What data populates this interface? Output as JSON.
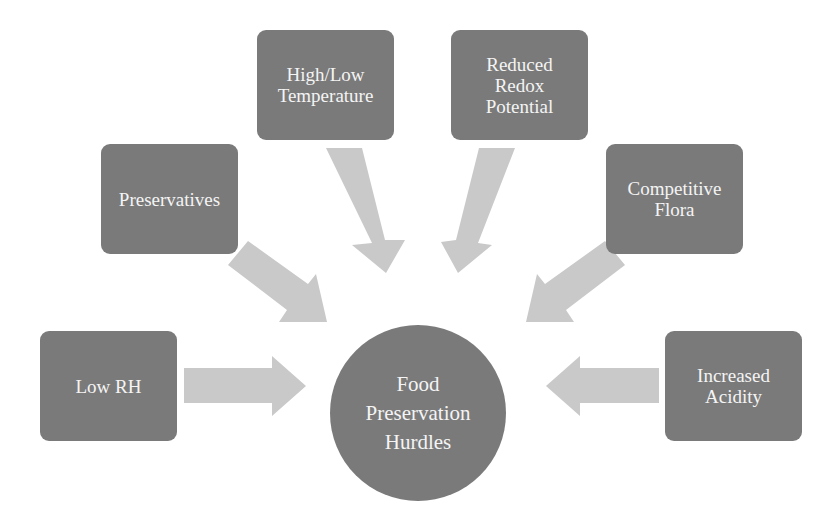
{
  "diagram": {
    "type": "hub-and-spoke",
    "center": {
      "lines": [
        "Food",
        "Preservation",
        "Hurdles"
      ]
    },
    "hurdles": [
      {
        "id": "low-rh",
        "label": "Low RH"
      },
      {
        "id": "preservatives",
        "label": "Preservatives"
      },
      {
        "id": "temperature",
        "label": "High/Low\nTemperature"
      },
      {
        "id": "redox",
        "label": "Reduced\nRedox\nPotential"
      },
      {
        "id": "competitive-flora",
        "label": "Competitive\nFlora"
      },
      {
        "id": "acidity",
        "label": "Increased\nAcidity"
      }
    ],
    "colors": {
      "box": "#7a7a7a",
      "arrow": "#c9c9c9",
      "text": "#f4f4f4",
      "background": "#ffffff"
    }
  }
}
